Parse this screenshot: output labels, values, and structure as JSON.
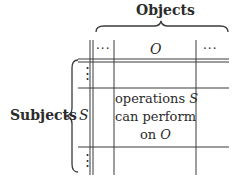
{
  "diagram": {
    "columns_label": "Objects",
    "rows_label": "Subjects",
    "column_headers": [
      "···",
      "O",
      "···"
    ],
    "row_headers": [
      "⋮",
      "S",
      "⋮"
    ],
    "cell": {
      "row": "S",
      "column": "O",
      "lines": [
        "operations S",
        "can perform",
        "on O"
      ]
    },
    "colors": {
      "ink": "#2b2b2b",
      "lines": "#3a3a3a",
      "background": "#ffffff"
    }
  }
}
